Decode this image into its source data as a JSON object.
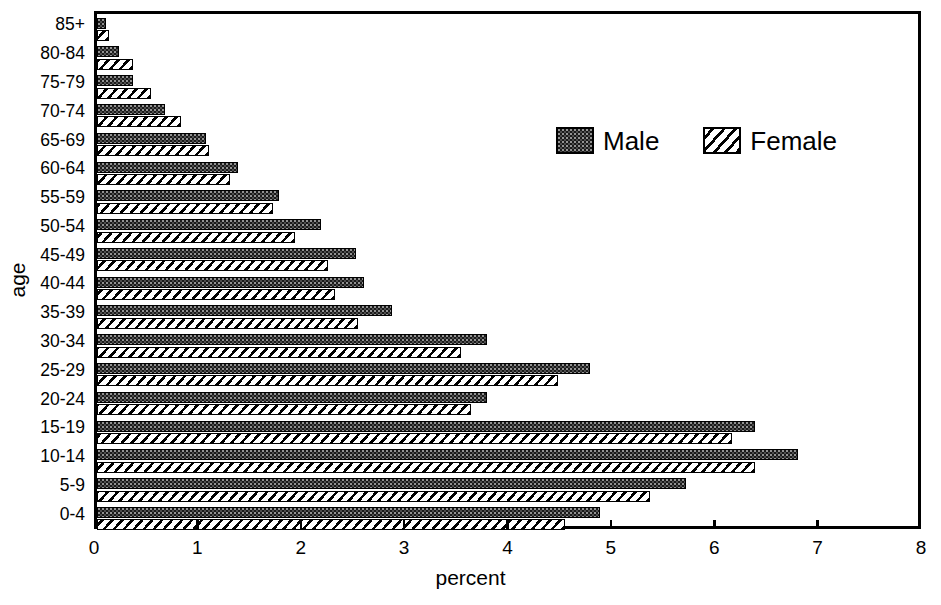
{
  "chart_data": {
    "type": "bar",
    "subtype": "population-pyramid-paired-horizontal-bars",
    "title": "",
    "xlabel": "percent",
    "ylabel": "age",
    "xlim": [
      0,
      8
    ],
    "xticks": [
      0,
      1,
      2,
      3,
      4,
      5,
      6,
      7,
      8
    ],
    "xtick_labels": [
      "0",
      "1",
      "2",
      "3",
      "4",
      "5",
      "6",
      "7",
      "8"
    ],
    "grid": false,
    "orientation": "horizontal",
    "legend": {
      "position": "upper-right-inside",
      "entries": [
        {
          "name": "Male",
          "pattern": "stippled-dark",
          "color": "#1a1a1a"
        },
        {
          "name": "Female",
          "pattern": "diagonal-hatch",
          "color": "#ffffff"
        }
      ]
    },
    "categories": [
      "85+",
      "80-84",
      "75-79",
      "70-74",
      "65-69",
      "60-64",
      "55-59",
      "50-54",
      "45-49",
      "40-44",
      "35-39",
      "30-34",
      "25-29",
      "20-24",
      "15-19",
      "10-14",
      "5-9",
      "0-4"
    ],
    "series": [
      {
        "name": "Male",
        "values": [
          0.09,
          0.21,
          0.35,
          0.66,
          1.05,
          1.36,
          1.76,
          2.17,
          2.51,
          2.58,
          2.85,
          3.77,
          4.77,
          3.77,
          6.37,
          6.78,
          5.7,
          4.87
        ]
      },
      {
        "name": "Female",
        "values": [
          0.12,
          0.35,
          0.52,
          0.81,
          1.08,
          1.29,
          1.7,
          1.92,
          2.23,
          2.3,
          2.52,
          3.52,
          4.46,
          3.62,
          6.14,
          6.37,
          5.35,
          4.53
        ]
      }
    ]
  },
  "axis": {
    "y_title": "age",
    "x_title": "percent"
  },
  "colors": {
    "male": "#1a1a1a",
    "female": "#ffffff",
    "axis": "#000000",
    "background": "#ffffff"
  }
}
